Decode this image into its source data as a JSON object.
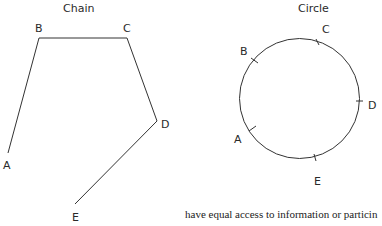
{
  "chain": {
    "title": "Chain",
    "nodes": [
      {
        "label": "A"
      },
      {
        "label": "B"
      },
      {
        "label": "C"
      },
      {
        "label": "D"
      },
      {
        "label": "E"
      }
    ]
  },
  "circle": {
    "title": "Circle",
    "nodes": [
      {
        "label": "A"
      },
      {
        "label": "B"
      },
      {
        "label": "C"
      },
      {
        "label": "D"
      },
      {
        "label": "E"
      }
    ]
  },
  "caption": "have equal access to information or particin",
  "colors": {
    "line": "#333333",
    "text": "#2a2a2a"
  }
}
